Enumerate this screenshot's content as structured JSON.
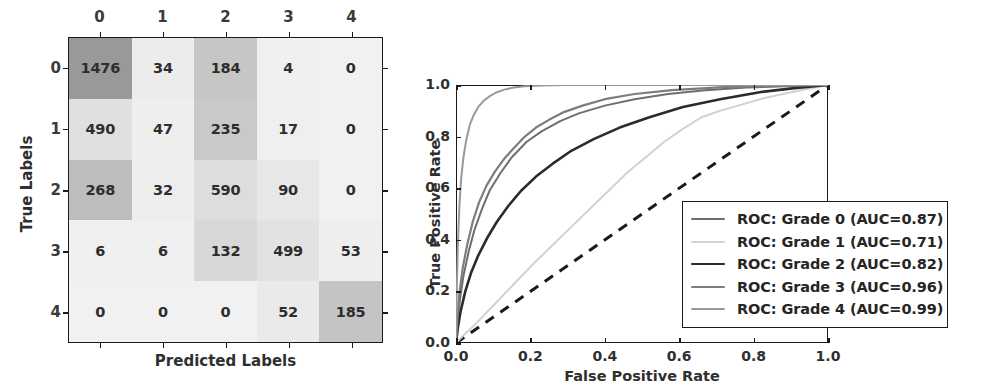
{
  "chart_data": [
    {
      "type": "heatmap",
      "title": "Confusion Matrix",
      "xlabel": "Predicted Labels",
      "ylabel": "True Labels",
      "categories_x": [
        "0",
        "1",
        "2",
        "3",
        "4"
      ],
      "categories_y": [
        "0",
        "1",
        "2",
        "3",
        "4"
      ],
      "grid": false,
      "matrix": [
        [
          1476,
          34,
          184,
          4,
          0
        ],
        [
          490,
          47,
          235,
          17,
          0
        ],
        [
          268,
          32,
          590,
          90,
          0
        ],
        [
          6,
          6,
          132,
          499,
          53
        ],
        [
          0,
          0,
          0,
          52,
          185
        ]
      ],
      "cell_shades": [
        [
          "#999999",
          "#ececec",
          "#c6c6c6",
          "#f0f0f0",
          "#f1f1f1"
        ],
        [
          "#e0e0e0",
          "#eeeeee",
          "#c9c9c9",
          "#efefef",
          "#f1f1f1"
        ],
        [
          "#bdbdbd",
          "#ededed",
          "#dddddd",
          "#e7e7e7",
          "#f1f1f1"
        ],
        [
          "#f0f0f0",
          "#f0f0f0",
          "#d8d8d8",
          "#e2e2e2",
          "#eeeeee"
        ],
        [
          "#f1f1f1",
          "#f1f1f1",
          "#f1f1f1",
          "#eaeaea",
          "#c4c4c4"
        ]
      ]
    },
    {
      "type": "line",
      "title": "ROC Curves",
      "xlabel": "False Positive Rate",
      "ylabel": "True Positive Rate",
      "xlim": [
        0.0,
        1.0
      ],
      "ylim": [
        0.0,
        1.0
      ],
      "xticks": [
        "0.0",
        "0.2",
        "0.4",
        "0.6",
        "0.8",
        "1.0"
      ],
      "yticks": [
        "0.0",
        "0.2",
        "0.4",
        "0.6",
        "0.8",
        "1.0"
      ],
      "grid": false,
      "legend_position": "lower right",
      "series": [
        {
          "name": "ROC: Grade 0 (AUC=0.87)",
          "grade": "0",
          "auc": 0.87,
          "color": "#6e6e6e",
          "width": 2.0,
          "points": [
            [
              0.0,
              0.0
            ],
            [
              0.005,
              0.09
            ],
            [
              0.01,
              0.16
            ],
            [
              0.02,
              0.26
            ],
            [
              0.035,
              0.36
            ],
            [
              0.05,
              0.44
            ],
            [
              0.07,
              0.52
            ],
            [
              0.09,
              0.59
            ],
            [
              0.12,
              0.66
            ],
            [
              0.15,
              0.72
            ],
            [
              0.19,
              0.78
            ],
            [
              0.23,
              0.82
            ],
            [
              0.28,
              0.86
            ],
            [
              0.33,
              0.89
            ],
            [
              0.4,
              0.92
            ],
            [
              0.48,
              0.945
            ],
            [
              0.57,
              0.965
            ],
            [
              0.67,
              0.98
            ],
            [
              0.78,
              0.99
            ],
            [
              0.88,
              0.995
            ],
            [
              1.0,
              1.0
            ]
          ]
        },
        {
          "name": "ROC: Grade 1 (AUC=0.71)",
          "grade": "1",
          "auc": 0.71,
          "color": "#d2d2d2",
          "width": 2.0,
          "points": [
            [
              0.0,
              0.0
            ],
            [
              0.02,
              0.03
            ],
            [
              0.05,
              0.07
            ],
            [
              0.09,
              0.13
            ],
            [
              0.13,
              0.19
            ],
            [
              0.17,
              0.25
            ],
            [
              0.21,
              0.31
            ],
            [
              0.26,
              0.38
            ],
            [
              0.31,
              0.45
            ],
            [
              0.36,
              0.52
            ],
            [
              0.41,
              0.59
            ],
            [
              0.46,
              0.66
            ],
            [
              0.51,
              0.72
            ],
            [
              0.56,
              0.78
            ],
            [
              0.61,
              0.83
            ],
            [
              0.66,
              0.875
            ],
            [
              0.71,
              0.9
            ],
            [
              0.77,
              0.925
            ],
            [
              0.83,
              0.95
            ],
            [
              0.9,
              0.972
            ],
            [
              1.0,
              1.0
            ]
          ]
        },
        {
          "name": "ROC: Grade 2 (AUC=0.82)",
          "grade": "2",
          "auc": 0.82,
          "color": "#2b2b2b",
          "width": 2.6,
          "points": [
            [
              0.0,
              0.0
            ],
            [
              0.005,
              0.06
            ],
            [
              0.012,
              0.12
            ],
            [
              0.025,
              0.2
            ],
            [
              0.04,
              0.27
            ],
            [
              0.06,
              0.34
            ],
            [
              0.085,
              0.41
            ],
            [
              0.11,
              0.47
            ],
            [
              0.14,
              0.53
            ],
            [
              0.175,
              0.59
            ],
            [
              0.215,
              0.645
            ],
            [
              0.26,
              0.695
            ],
            [
              0.31,
              0.745
            ],
            [
              0.37,
              0.79
            ],
            [
              0.44,
              0.835
            ],
            [
              0.52,
              0.875
            ],
            [
              0.61,
              0.915
            ],
            [
              0.71,
              0.945
            ],
            [
              0.82,
              0.973
            ],
            [
              0.91,
              0.988
            ],
            [
              1.0,
              1.0
            ]
          ]
        },
        {
          "name": "ROC: Grade 3 (AUC=0.96)",
          "grade": "3",
          "auc": 0.96,
          "color": "#7d7d7d",
          "width": 2.2,
          "points": [
            [
              0.0,
              0.0
            ],
            [
              0.004,
              0.1
            ],
            [
              0.009,
              0.19
            ],
            [
              0.018,
              0.29
            ],
            [
              0.03,
              0.38
            ],
            [
              0.045,
              0.47
            ],
            [
              0.062,
              0.545
            ],
            [
              0.082,
              0.61
            ],
            [
              0.105,
              0.665
            ],
            [
              0.13,
              0.715
            ],
            [
              0.155,
              0.755
            ],
            [
              0.185,
              0.8
            ],
            [
              0.215,
              0.835
            ],
            [
              0.25,
              0.865
            ],
            [
              0.29,
              0.895
            ],
            [
              0.34,
              0.92
            ],
            [
              0.4,
              0.945
            ],
            [
              0.48,
              0.965
            ],
            [
              0.58,
              0.98
            ],
            [
              0.72,
              0.992
            ],
            [
              1.0,
              1.0
            ]
          ]
        },
        {
          "name": "ROC: Grade 4 (AUC=0.99)",
          "grade": "4",
          "auc": 0.99,
          "color": "#999999",
          "width": 2.0,
          "points": [
            [
              0.0,
              0.0
            ],
            [
              0.002,
              0.2
            ],
            [
              0.005,
              0.38
            ],
            [
              0.009,
              0.53
            ],
            [
              0.014,
              0.64
            ],
            [
              0.02,
              0.72
            ],
            [
              0.028,
              0.79
            ],
            [
              0.037,
              0.845
            ],
            [
              0.048,
              0.885
            ],
            [
              0.06,
              0.915
            ],
            [
              0.075,
              0.94
            ],
            [
              0.092,
              0.958
            ],
            [
              0.11,
              0.972
            ],
            [
              0.13,
              0.982
            ],
            [
              0.155,
              0.99
            ],
            [
              0.185,
              0.995
            ],
            [
              0.23,
              0.998
            ],
            [
              0.3,
              1.0
            ],
            [
              0.5,
              1.0
            ],
            [
              0.75,
              1.0
            ],
            [
              1.0,
              1.0
            ]
          ]
        }
      ],
      "reference_line": {
        "name": "chance-diagonal",
        "style": "dashed",
        "color": "#1a1a1a",
        "points": [
          [
            0.0,
            0.0
          ],
          [
            1.0,
            1.0
          ]
        ]
      }
    }
  ],
  "confusion_matrix": {
    "xlabel": "Predicted Labels",
    "ylabel": "True Labels",
    "col_labels": [
      "0",
      "1",
      "2",
      "3",
      "4"
    ],
    "row_labels": [
      "0",
      "1",
      "2",
      "3",
      "4"
    ],
    "rows": [
      [
        "1476",
        "34",
        "184",
        "4",
        "0"
      ],
      [
        "490",
        "47",
        "235",
        "17",
        "0"
      ],
      [
        "268",
        "32",
        "590",
        "90",
        "0"
      ],
      [
        "6",
        "6",
        "132",
        "499",
        "53"
      ],
      [
        "0",
        "0",
        "0",
        "52",
        "185"
      ]
    ]
  },
  "roc": {
    "xlabel": "False Positive Rate",
    "ylabel": "True Positive Rate",
    "xticks": [
      "0.0",
      "0.2",
      "0.4",
      "0.6",
      "0.8",
      "1.0"
    ],
    "yticks": [
      "0.0",
      "0.2",
      "0.4",
      "0.6",
      "0.8",
      "1.0"
    ],
    "legend": [
      {
        "label": "ROC: Grade 0 (AUC=0.87)",
        "color": "#6e6e6e",
        "width": 2.0
      },
      {
        "label": "ROC: Grade 1 (AUC=0.71)",
        "color": "#d2d2d2",
        "width": 2.0
      },
      {
        "label": "ROC: Grade 2 (AUC=0.82)",
        "color": "#2b2b2b",
        "width": 2.6
      },
      {
        "label": "ROC: Grade 3 (AUC=0.96)",
        "color": "#7d7d7d",
        "width": 2.2
      },
      {
        "label": "ROC: Grade 4 (AUC=0.99)",
        "color": "#999999",
        "width": 2.0
      }
    ]
  }
}
